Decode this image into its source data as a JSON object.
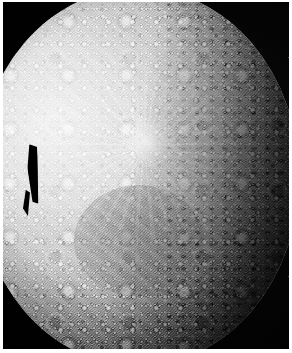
{
  "image": {
    "subject": "heavily cratered icy moon",
    "title": "Cratered Moon Surface",
    "capture_type": "spacecraft grayscale photograph",
    "color_mode": "grayscale",
    "width_px": 292,
    "height_px": 353,
    "background_label": "deep space",
    "alt_text": "Grayscale spacecraft photograph of a densely cratered moon. The illuminated disc fills most of the frame with its bright limb along the left and upper-left, the heavily shadowed terminator fading into black along the right edge, and black space in the corners. A small black wedge-shaped data-dropout artifact interrupts the bright left limb near mid-height."
  },
  "colors": {
    "space_black": "#000000",
    "plate_black": "#050505",
    "paper_margin": "#ffffff",
    "highlight_white": "#f4f4f4",
    "midtone_gray": "#a0a0a0",
    "shadow_gray": "#3a3a3a",
    "terminator_black": "#141414"
  },
  "features": [
    {
      "name": "illuminated-limb",
      "label": "Bright illuminated limb",
      "position": "left and upper-left edge of disc"
    },
    {
      "name": "terminator",
      "label": "Terminator (day-night boundary)",
      "position": "right edge of disc"
    },
    {
      "name": "fresh-crater",
      "label": "Bright fresh impact crater with ray system",
      "position": "upper-middle of disc"
    },
    {
      "name": "impact-basin",
      "label": "Broad shallow impact basin",
      "position": "lower-middle of disc"
    },
    {
      "name": "crater-field",
      "label": "Dense saturated crater field",
      "position": "across the entire illuminated hemisphere"
    },
    {
      "name": "data-dropout",
      "label": "Black data-dropout artifact",
      "position": "left limb, middle height"
    },
    {
      "name": "space-background",
      "label": "Black space background",
      "position": "image corners"
    }
  ]
}
